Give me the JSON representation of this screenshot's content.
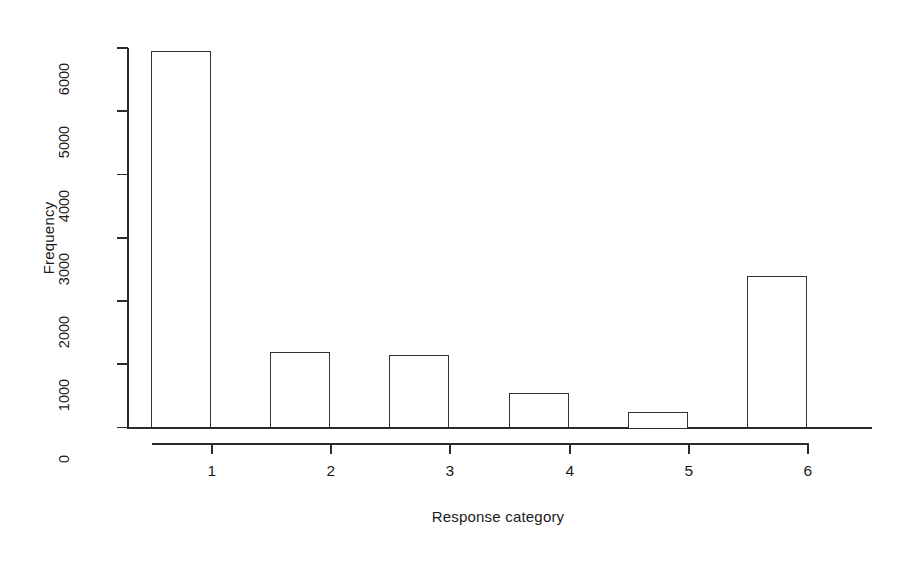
{
  "chart_data": {
    "type": "bar",
    "title": "",
    "xlabel": "Response category",
    "ylabel": "Frequency",
    "categories": [
      "1",
      "2",
      "3",
      "4",
      "5",
      "6"
    ],
    "values": [
      5950,
      1190,
      1140,
      550,
      250,
      2400
    ],
    "ylim": [
      0,
      6000
    ],
    "yticks": [
      0,
      1000,
      2000,
      3000,
      4000,
      5000,
      6000
    ],
    "ytick_labels": [
      "0",
      "1000",
      "2000",
      "3000",
      "4000",
      "5000",
      "6000"
    ],
    "grid": false,
    "legend": false,
    "bar_fill": "#ffffff",
    "bar_border": "#333333",
    "axis_color": "#2b2b2b",
    "background": "#ffffff"
  },
  "axes": {
    "y_label": "Frequency",
    "x_label": "Response category"
  }
}
